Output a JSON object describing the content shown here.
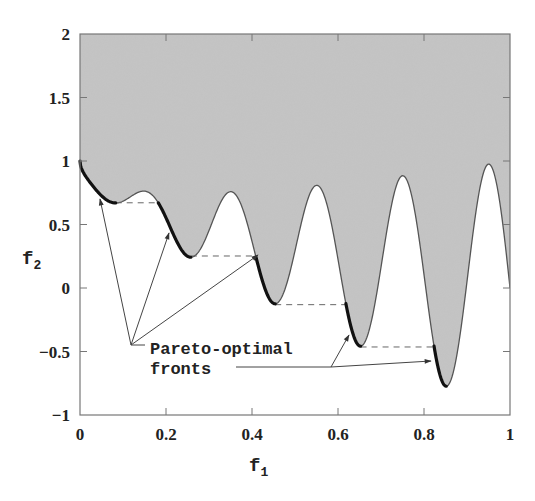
{
  "chart_data": {
    "type": "area",
    "title": "",
    "xlabel": "f",
    "xlabel_sub": "1",
    "ylabel": "f",
    "ylabel_sub": "2",
    "xlim": [
      0,
      1
    ],
    "ylim": [
      -1,
      2
    ],
    "xticks": [
      0,
      0.2,
      0.4,
      0.6,
      0.8,
      1
    ],
    "xtick_labels": [
      "0",
      "0.2",
      "0.4",
      "0.6",
      "0.8",
      "1"
    ],
    "yticks": [
      -1,
      -0.5,
      0,
      0.5,
      1,
      1.5,
      2
    ],
    "ytick_labels": [
      "−1",
      "−0.5",
      "0",
      "0.5",
      "1",
      "1.5",
      "2"
    ],
    "grid": false,
    "legend": null,
    "curve": {
      "name": "boundary of feasible objective space",
      "formula": "f2 = 1 - sqrt(f1) - f1*sin(10*pi*f1)",
      "x": [
        0,
        0.025,
        0.05,
        0.075,
        0.1,
        0.125,
        0.15,
        0.175,
        0.2,
        0.225,
        0.25,
        0.275,
        0.3,
        0.325,
        0.35,
        0.375,
        0.4,
        0.425,
        0.45,
        0.475,
        0.5,
        0.525,
        0.55,
        0.575,
        0.6,
        0.625,
        0.65,
        0.675,
        0.7,
        0.725,
        0.75,
        0.775,
        0.8,
        0.825,
        0.85,
        0.875,
        0.9,
        0.925,
        0.95,
        0.975,
        1.0
      ],
      "y": [
        1.0,
        0.81,
        0.726,
        0.673,
        0.684,
        0.734,
        0.763,
        0.71,
        0.553,
        0.367,
        0.25,
        0.281,
        0.452,
        0.659,
        0.758,
        0.634,
        0.368,
        0.081,
        -0.121,
        -0.138,
        0.0,
        0.138,
        0.258,
        0.129,
        -0.075,
        -0.23,
        -0.456,
        -0.43,
        -0.037,
        0.367,
        0.884,
        0.487,
        -0.152,
        -0.728,
        -0.772,
        0.148,
        0.051,
        0.688,
        0.975,
        0.663,
        0.0
      ],
      "fill": "feasible region above curve shaded gray"
    },
    "pareto_fronts": [
      {
        "f1_start": 0.0,
        "f1_end": 0.083,
        "f2_end": 0.671
      },
      {
        "f1_start": 0.1822,
        "f1_end": 0.2578,
        "f2_end": 0.252
      },
      {
        "f1_start": 0.4093,
        "f1_end": 0.4539,
        "f2_end": -0.1312
      },
      {
        "f1_start": 0.6183,
        "f1_end": 0.6525,
        "f2_end": -0.4644
      },
      {
        "f1_start": 0.8233,
        "f1_end": 0.8518,
        "f2_end": -0.7737
      }
    ],
    "dashed_connectors": [
      {
        "from_f1": 0.083,
        "to_f1": 0.1822,
        "f2": 0.671
      },
      {
        "from_f1": 0.2578,
        "to_f1": 0.4093,
        "f2": 0.252
      },
      {
        "from_f1": 0.4539,
        "to_f1": 0.6183,
        "f2": -0.1312
      },
      {
        "from_f1": 0.6525,
        "to_f1": 0.8233,
        "f2": -0.4644
      }
    ],
    "annotation": {
      "line1": "Pareto-optimal",
      "line2": "fronts"
    },
    "colors": {
      "feasible_fill": "#c4c4c4",
      "curve": "#555555",
      "front": "#111111",
      "axis": "#777777",
      "text": "#222222"
    }
  }
}
